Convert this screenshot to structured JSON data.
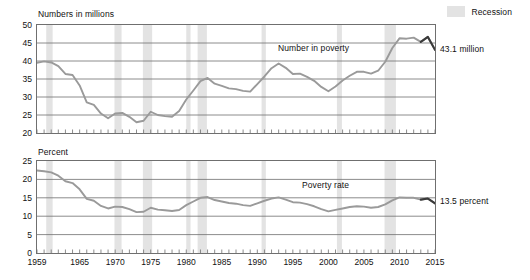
{
  "legend": {
    "recession_label": "Recession",
    "recession_color": "#e3e3e3"
  },
  "annotations": {
    "numbers_callout": "43.1  million",
    "percent_callout": "13.5  percent",
    "numbers_series_label": "Number in poverty",
    "percent_series_label": "Poverty rate"
  },
  "chart_data": [
    {
      "type": "line",
      "title": "",
      "ylabel": "Numbers  in millions",
      "xlabel": "",
      "ylim": [
        20,
        50
      ],
      "yticks": [
        20,
        25,
        30,
        35,
        40,
        45,
        50
      ],
      "ytick_labels": [
        "20",
        "25",
        "30",
        "35",
        "40",
        "45",
        "50"
      ],
      "xlim": [
        1959,
        2015
      ],
      "xticks": [
        1959,
        1965,
        1970,
        1975,
        1980,
        1985,
        1990,
        1995,
        2000,
        2005,
        2010,
        2015
      ],
      "xtick_labels": [
        "1959",
        "1965",
        "1970",
        "1975",
        "1980",
        "1985",
        "1990",
        "1995",
        "2000",
        "2005",
        "2010",
        "2015"
      ],
      "grid": true,
      "legend_position": "top-right",
      "line_color": "#9a9a9a",
      "highlight_color": "#3a3a3a",
      "series": [
        {
          "name": "Number in poverty",
          "x": [
            1959,
            1960,
            1961,
            1962,
            1963,
            1964,
            1965,
            1966,
            1967,
            1968,
            1969,
            1970,
            1971,
            1972,
            1973,
            1974,
            1975,
            1976,
            1977,
            1978,
            1979,
            1980,
            1981,
            1982,
            1983,
            1984,
            1985,
            1986,
            1987,
            1988,
            1989,
            1990,
            1991,
            1992,
            1993,
            1994,
            1995,
            1996,
            1997,
            1998,
            1999,
            2000,
            2001,
            2002,
            2003,
            2004,
            2005,
            2006,
            2007,
            2008,
            2009,
            2010,
            2011,
            2012,
            2013,
            2014,
            2015
          ],
          "values": [
            39.5,
            39.9,
            39.6,
            38.6,
            36.4,
            36.1,
            33.2,
            28.5,
            27.8,
            25.4,
            24.1,
            25.4,
            25.6,
            24.5,
            23.0,
            23.4,
            25.9,
            25.0,
            24.7,
            24.5,
            26.1,
            29.3,
            31.8,
            34.4,
            35.3,
            33.7,
            33.1,
            32.4,
            32.2,
            31.7,
            31.5,
            33.6,
            35.7,
            38.0,
            39.3,
            38.1,
            36.4,
            36.5,
            35.6,
            34.5,
            32.8,
            31.6,
            32.9,
            34.6,
            35.9,
            37.0,
            37.0,
            36.5,
            37.3,
            39.8,
            43.6,
            46.3,
            46.2,
            46.5,
            45.3,
            46.7,
            43.1
          ]
        }
      ],
      "highlight_segment": {
        "name": "final-segment",
        "x": [
          2013,
          2014,
          2015
        ],
        "values": [
          45.3,
          46.7,
          43.1
        ]
      },
      "recession_bands": [
        [
          1960.3,
          1961.2
        ],
        [
          1969.9,
          1970.9
        ],
        [
          1973.9,
          1975.2
        ],
        [
          1980.0,
          1980.6
        ],
        [
          1981.6,
          1982.9
        ],
        [
          1990.6,
          1991.2
        ],
        [
          2001.2,
          2001.9
        ],
        [
          2007.9,
          2009.5
        ]
      ]
    },
    {
      "type": "line",
      "title": "",
      "ylabel": "Percent",
      "xlabel": "",
      "ylim": [
        0,
        25
      ],
      "yticks": [
        0,
        5,
        10,
        15,
        20,
        25
      ],
      "ytick_labels": [
        "0",
        "5",
        "10",
        "15",
        "20",
        "25"
      ],
      "xlim": [
        1959,
        2015
      ],
      "xticks": [
        1959,
        1965,
        1970,
        1975,
        1980,
        1985,
        1990,
        1995,
        2000,
        2005,
        2010,
        2015
      ],
      "xtick_labels": [
        "1959",
        "1965",
        "1970",
        "1975",
        "1980",
        "1985",
        "1990",
        "1995",
        "2000",
        "2005",
        "2010",
        "2015"
      ],
      "grid": true,
      "line_color": "#9a9a9a",
      "highlight_color": "#3a3a3a",
      "series": [
        {
          "name": "Poverty rate",
          "x": [
            1959,
            1960,
            1961,
            1962,
            1963,
            1964,
            1965,
            1966,
            1967,
            1968,
            1969,
            1970,
            1971,
            1972,
            1973,
            1974,
            1975,
            1976,
            1977,
            1978,
            1979,
            1980,
            1981,
            1982,
            1983,
            1984,
            1985,
            1986,
            1987,
            1988,
            1989,
            1990,
            1991,
            1992,
            1993,
            1994,
            1995,
            1996,
            1997,
            1998,
            1999,
            2000,
            2001,
            2002,
            2003,
            2004,
            2005,
            2006,
            2007,
            2008,
            2009,
            2010,
            2011,
            2012,
            2013,
            2014,
            2015
          ],
          "values": [
            22.4,
            22.2,
            21.9,
            21.0,
            19.5,
            19.0,
            17.3,
            14.7,
            14.2,
            12.8,
            12.1,
            12.6,
            12.5,
            11.9,
            11.1,
            11.2,
            12.3,
            11.8,
            11.6,
            11.4,
            11.7,
            13.0,
            14.0,
            15.0,
            15.2,
            14.4,
            14.0,
            13.6,
            13.4,
            13.0,
            12.8,
            13.5,
            14.2,
            14.8,
            15.1,
            14.5,
            13.8,
            13.7,
            13.3,
            12.7,
            11.9,
            11.3,
            11.7,
            12.1,
            12.5,
            12.7,
            12.6,
            12.3,
            12.5,
            13.2,
            14.3,
            15.1,
            15.0,
            15.0,
            14.5,
            14.8,
            13.5
          ]
        }
      ],
      "highlight_segment": {
        "name": "final-segment",
        "x": [
          2013,
          2014,
          2015
        ],
        "values": [
          14.5,
          14.8,
          13.5
        ]
      },
      "recession_bands": [
        [
          1960.3,
          1961.2
        ],
        [
          1969.9,
          1970.9
        ],
        [
          1973.9,
          1975.2
        ],
        [
          1980.0,
          1980.6
        ],
        [
          1981.6,
          1982.9
        ],
        [
          1990.6,
          1991.2
        ],
        [
          2001.2,
          2001.9
        ],
        [
          2007.9,
          2009.5
        ]
      ]
    }
  ]
}
